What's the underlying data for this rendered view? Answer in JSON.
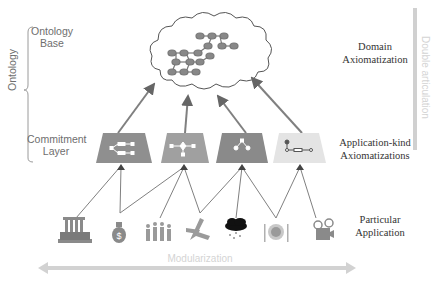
{
  "left_labels": {
    "ontology_base_line1": "Ontology",
    "ontology_base_line2": "Base",
    "ontology": "Ontology",
    "commitment_line1": "Commitment",
    "commitment_line2": "Layer"
  },
  "right_labels": {
    "domain_line1": "Domain",
    "domain_line2": "Axiomatization",
    "appkind_line1": "Application-kind",
    "appkind_line2": "Axiomatizations",
    "particular_line1": "Particular",
    "particular_line2": "Application"
  },
  "side_axis": {
    "label": "Double articulation"
  },
  "bottom_axis": {
    "label": "Modularization"
  },
  "commitment_modules": [
    {
      "name": "module-1",
      "color": "#8f8f8f"
    },
    {
      "name": "module-2",
      "color": "#a0a0a0"
    },
    {
      "name": "module-3",
      "color": "#8a8a8a"
    },
    {
      "name": "module-4",
      "color": "#e4e4e4"
    }
  ],
  "applications": [
    "bank-icon",
    "money-bag-icon",
    "people-icon",
    "airplane-icon",
    "weather-icon",
    "dining-icon",
    "film-projector-icon"
  ]
}
